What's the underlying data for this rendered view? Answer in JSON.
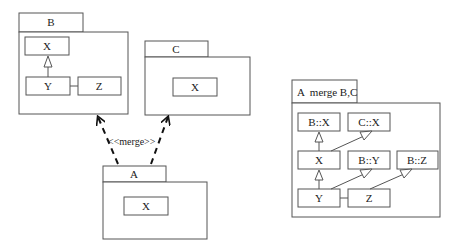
{
  "packages": {
    "b": {
      "name": "B",
      "classes": {
        "x": "X",
        "y": "Y",
        "z": "Z"
      }
    },
    "c": {
      "name": "C",
      "classes": {
        "x": "X"
      }
    },
    "a": {
      "name": "A",
      "classes": {
        "x": "X"
      }
    },
    "merged": {
      "name": "A  merge B,C",
      "classes": {
        "bx": "B::X",
        "cx": "C::X",
        "x": "X",
        "by": "B::Y",
        "bz": "B::Z",
        "y": "Y",
        "z": "Z"
      }
    }
  },
  "relations": {
    "merge_label": "<<merge>>"
  }
}
